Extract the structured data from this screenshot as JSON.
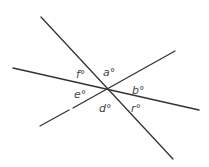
{
  "diagram": {
    "type": "intersecting-lines",
    "intersection": [
      107,
      89
    ],
    "lines": [
      {
        "id": "line-1",
        "from": [
          41,
          17
        ],
        "to": [
          173,
          159
        ]
      },
      {
        "id": "line-2",
        "from": [
          13,
          68
        ],
        "to": [
          199,
          110
        ]
      },
      {
        "id": "line-3",
        "from": [
          40,
          126
        ],
        "to": [
          175,
          51
        ]
      }
    ],
    "angles": [
      {
        "id": "a",
        "label": "a°",
        "pos": [
          103,
          76
        ]
      },
      {
        "id": "b",
        "label": "b°",
        "pos": [
          132,
          94
        ]
      },
      {
        "id": "r",
        "label": "r°",
        "pos": [
          131,
          112
        ]
      },
      {
        "id": "d",
        "label": "d°",
        "pos": [
          99,
          112
        ]
      },
      {
        "id": "e",
        "label": "e°",
        "pos": [
          74,
          98
        ]
      },
      {
        "id": "f",
        "label": "f°",
        "pos": [
          76,
          78
        ]
      }
    ]
  }
}
